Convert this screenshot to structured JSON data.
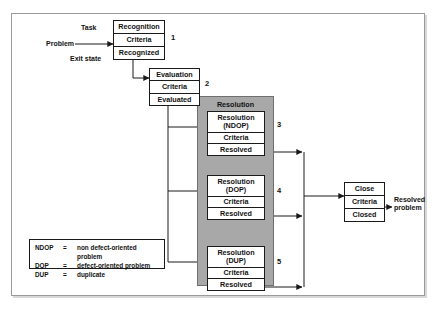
{
  "diagram": {
    "colors": {
      "group_fill": "#a8a8a8",
      "group_border": "#6f6f6f",
      "box_border": "#1a1a1a",
      "line": "#1a1a1a",
      "frame_border": "#9a9a9a",
      "background": "#ffffff"
    },
    "inputs": [
      {
        "name": "task",
        "label": "Task"
      },
      {
        "name": "problem",
        "label": "Problem"
      },
      {
        "name": "exit-state",
        "label": "Exit state"
      }
    ],
    "output": {
      "name": "resolved-problem",
      "label": "Resolved\nproblem"
    },
    "group": {
      "label": "Resolution"
    },
    "states": [
      {
        "id": "recognition",
        "number": "1",
        "cells": [
          "Recognition",
          "Criteria",
          "Recognized"
        ]
      },
      {
        "id": "evaluation",
        "number": "2",
        "cells": [
          "Evaluation",
          "Criteria",
          "Evaluated"
        ]
      },
      {
        "id": "resolution-ndop",
        "number": "3",
        "cells": [
          "Resolution\n(NDOP)",
          "Criteria",
          "Resolved"
        ]
      },
      {
        "id": "resolution-dop",
        "number": "4",
        "cells": [
          "Resolution\n(DOP)",
          "Criteria",
          "Resolved"
        ]
      },
      {
        "id": "resolution-dup",
        "number": "5",
        "cells": [
          "Resolution\n(DUP)",
          "Criteria",
          "Resolved"
        ]
      },
      {
        "id": "close",
        "number": "",
        "cells": [
          "Close",
          "Criteria",
          "Closed"
        ]
      }
    ],
    "legend": {
      "equals": "=",
      "rows": [
        {
          "abbr": "NDOP",
          "definition": "non defect-oriented problem"
        },
        {
          "abbr": "DOP",
          "definition": "defect-oriented problem"
        },
        {
          "abbr": "DUP",
          "definition": "duplicate"
        }
      ]
    }
  }
}
